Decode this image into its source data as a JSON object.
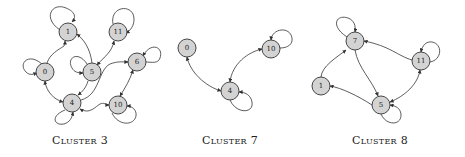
{
  "colors": {
    "node_fill": "#d3d3d3",
    "node_stroke": "#333333",
    "edge": "#333333",
    "background": "#ffffff"
  },
  "clusters": [
    {
      "caption": "Cluster 3",
      "nodes": [
        {
          "id": "1",
          "label": "1"
        },
        {
          "id": "11",
          "label": "11"
        },
        {
          "id": "0",
          "label": "0"
        },
        {
          "id": "5",
          "label": "5"
        },
        {
          "id": "6",
          "label": "6"
        },
        {
          "id": "4",
          "label": "4"
        },
        {
          "id": "10",
          "label": "10"
        }
      ],
      "edges": [
        {
          "from": "1",
          "to": "1",
          "type": "self-loop"
        },
        {
          "from": "11",
          "to": "11",
          "type": "self-loop"
        },
        {
          "from": "0",
          "to": "0",
          "type": "self-loop"
        },
        {
          "from": "5",
          "to": "5",
          "type": "self-loop"
        },
        {
          "from": "6",
          "to": "6",
          "type": "self-loop"
        },
        {
          "from": "4",
          "to": "4",
          "type": "self-loop"
        },
        {
          "from": "10",
          "to": "10",
          "type": "self-loop"
        },
        {
          "from": "0",
          "to": "1",
          "type": "directed"
        },
        {
          "from": "5",
          "to": "1",
          "type": "directed"
        },
        {
          "from": "5",
          "to": "11",
          "type": "bidirectional"
        },
        {
          "from": "0",
          "to": "4",
          "type": "bidirectional"
        },
        {
          "from": "5",
          "to": "4",
          "type": "directed"
        },
        {
          "from": "4",
          "to": "6",
          "type": "directed"
        },
        {
          "from": "6",
          "to": "10",
          "type": "bidirectional"
        },
        {
          "from": "4",
          "to": "10",
          "type": "bidirectional"
        }
      ]
    },
    {
      "caption": "Cluster 7",
      "nodes": [
        {
          "id": "0",
          "label": "0"
        },
        {
          "id": "10",
          "label": "10"
        },
        {
          "id": "4",
          "label": "4"
        }
      ],
      "edges": [
        {
          "from": "10",
          "to": "10",
          "type": "self-loop"
        },
        {
          "from": "4",
          "to": "4",
          "type": "self-loop"
        },
        {
          "from": "0",
          "to": "4",
          "type": "bidirectional"
        },
        {
          "from": "4",
          "to": "10",
          "type": "bidirectional"
        }
      ]
    },
    {
      "caption": "Cluster 8",
      "nodes": [
        {
          "id": "7",
          "label": "7"
        },
        {
          "id": "11",
          "label": "11"
        },
        {
          "id": "1",
          "label": "1"
        },
        {
          "id": "5",
          "label": "5"
        }
      ],
      "edges": [
        {
          "from": "7",
          "to": "7",
          "type": "self-loop"
        },
        {
          "from": "11",
          "to": "11",
          "type": "self-loop"
        },
        {
          "from": "5",
          "to": "5",
          "type": "self-loop"
        },
        {
          "from": "1",
          "to": "7",
          "type": "directed"
        },
        {
          "from": "11",
          "to": "7",
          "type": "directed"
        },
        {
          "from": "7",
          "to": "5",
          "type": "directed"
        },
        {
          "from": "5",
          "to": "11",
          "type": "bidirectional"
        },
        {
          "from": "5",
          "to": "1",
          "type": "directed"
        }
      ]
    }
  ]
}
